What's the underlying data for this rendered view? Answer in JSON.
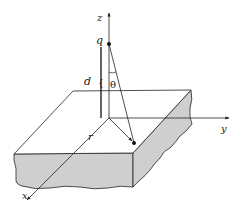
{
  "diagram": {
    "labels": {
      "z_axis": "z",
      "y_axis": "y",
      "x_axis": "x",
      "charge": "q",
      "distance": "d",
      "angle": "θ",
      "radius": "r"
    },
    "colors": {
      "line": "#222222",
      "slab_side_fill": "#cfcfcf",
      "slab_top_fill": "#ffffff",
      "background": "#ffffff"
    }
  }
}
